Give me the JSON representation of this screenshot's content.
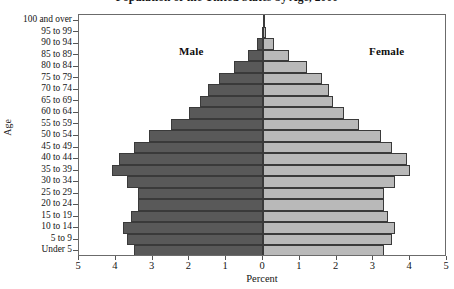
{
  "chart_data": {
    "type": "bar",
    "subtype": "population-pyramid",
    "title": "Population of the United States by Age, 2000",
    "xlabel": "Percent",
    "ylabel": "Age",
    "grid": false,
    "legend_position": "in-plot",
    "orientation": "horizontal",
    "axis": {
      "x_center_value": 0,
      "x_half_range": 5,
      "x_ticks_left": [
        5,
        4,
        3,
        2,
        1
      ],
      "x_tick_center": [
        0
      ],
      "x_ticks_right": [
        1,
        2,
        3,
        4,
        5
      ],
      "x_tick_labels": [
        "5",
        "4",
        "3",
        "2",
        "1",
        "0",
        "1",
        "2",
        "3",
        "4",
        "5"
      ],
      "xlim": [
        -5,
        5
      ]
    },
    "categories": [
      "Under 5",
      "5 to 9",
      "10 to 14",
      "15 to 19",
      "20 to 24",
      "25 to 29",
      "30 to 34",
      "35 to 39",
      "40 to 44",
      "45 to 49",
      "50 to 54",
      "55 to 59",
      "60 to 64",
      "65 to 69",
      "70 to 74",
      "75 to 79",
      "80 to 84",
      "85 to 89",
      "90 to 94",
      "95 to 99",
      "100 and over"
    ],
    "series": [
      {
        "name": "Male",
        "side": "left",
        "color": "#595959",
        "values": [
          3.5,
          3.7,
          3.8,
          3.6,
          3.4,
          3.4,
          3.7,
          4.1,
          3.9,
          3.5,
          3.1,
          2.5,
          2.0,
          1.7,
          1.5,
          1.2,
          0.8,
          0.4,
          0.15,
          0.04,
          0.01
        ]
      },
      {
        "name": "Female",
        "side": "right",
        "color": "#b9b9b9",
        "values": [
          3.3,
          3.5,
          3.6,
          3.4,
          3.3,
          3.3,
          3.6,
          4.0,
          3.9,
          3.5,
          3.2,
          2.6,
          2.2,
          1.9,
          1.8,
          1.6,
          1.2,
          0.7,
          0.3,
          0.09,
          0.02
        ]
      }
    ],
    "annotations": [
      {
        "name": "male-label",
        "text": "Male"
      },
      {
        "name": "female-label",
        "text": "Female"
      }
    ]
  }
}
